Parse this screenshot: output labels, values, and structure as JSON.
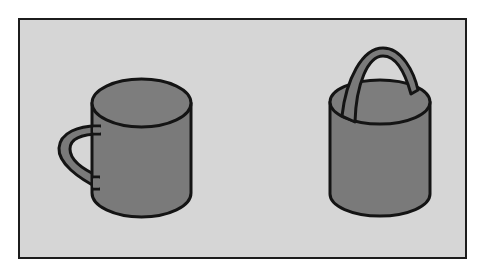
{
  "figure": {
    "panel": {
      "background_color": "#d6d6d6",
      "border_color": "#1c1c1c"
    },
    "objects": [
      {
        "id": "mug",
        "label": "mug",
        "fill_color": "#7a7a7a",
        "handle_position": "side"
      },
      {
        "id": "bucket",
        "label": "bucket",
        "fill_color": "#7a7a7a",
        "handle_position": "top"
      }
    ],
    "colors": {
      "outline": "#141414",
      "body": "#7a7a7a",
      "body_top": "#7f7f7f",
      "handle": "#7a7a7a"
    }
  }
}
